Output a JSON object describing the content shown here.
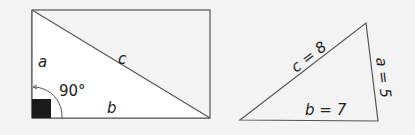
{
  "colors": {
    "background": "#f3f3f3",
    "triangle_fill": "#ffffff",
    "line": "#555555",
    "right_angle_marker": "#1a1a1a"
  },
  "left_figure": {
    "description": "Rectangle split by diagonal into right triangle",
    "labels": {
      "side_a": "a",
      "side_b": "b",
      "hypotenuse_c": "c",
      "angle": "90°"
    }
  },
  "right_figure": {
    "description": "Triangle with labeled sides",
    "labels": {
      "side_c": "c = 8",
      "side_a": "a = 5",
      "side_b": "b = 7"
    }
  }
}
